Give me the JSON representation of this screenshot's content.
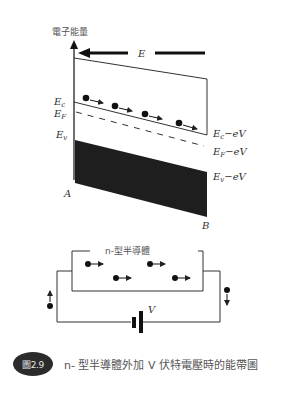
{
  "diagram": {
    "axis": {
      "y_label": "電子能量"
    },
    "field": {
      "label": "E",
      "direction": "left"
    },
    "left_levels": {
      "ec": "E",
      "ec_sub": "c",
      "ef": "E",
      "ef_sub": "F",
      "ev": "E",
      "ev_sub": "v"
    },
    "right_levels": {
      "ec": "E",
      "ec_sub": "c",
      "ec_suffix": "−eV",
      "ef": "E",
      "ef_sub": "F",
      "ef_suffix": "−eV",
      "ev": "E",
      "ev_sub": "v",
      "ev_suffix": "−eV"
    },
    "points": {
      "a": "A",
      "b": "B"
    },
    "circuit": {
      "semiconductor_label": "n-型半導體",
      "voltage_label": "V"
    },
    "colors": {
      "line": "#333333",
      "band_fill": "#1e1e1e",
      "badge": "#2b2b2b"
    }
  },
  "caption": {
    "badge": "圖2.9",
    "text": "n- 型半導體外加 V 伏特電壓時的能帶圖"
  }
}
